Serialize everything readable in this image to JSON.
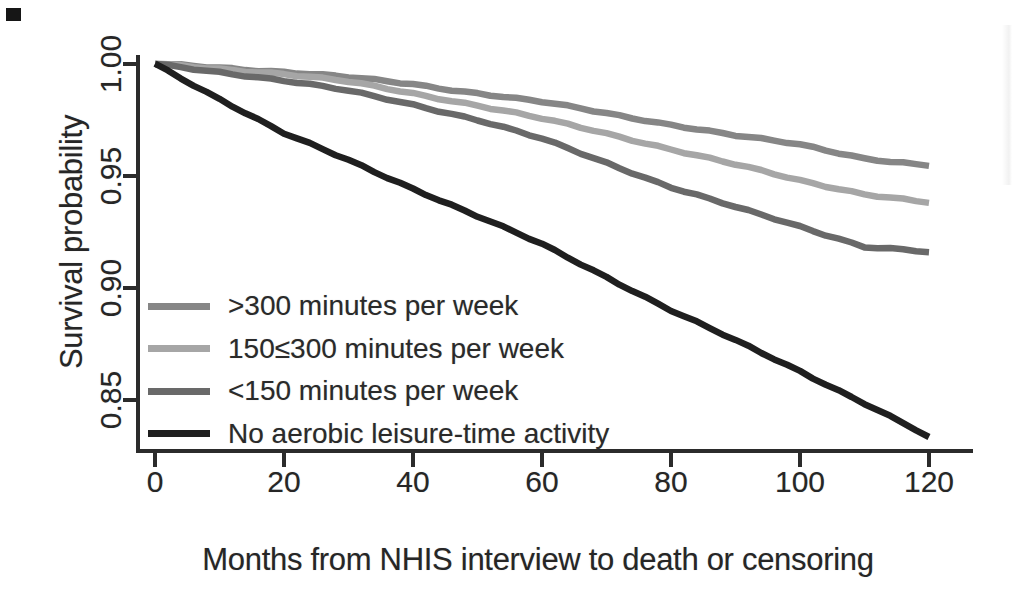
{
  "colors": {
    "background": "#ffffff",
    "axis": "#2b2b2b",
    "text": "#262626",
    "artifact_mark": "#161616"
  },
  "chart_data": {
    "type": "line",
    "title": "",
    "xlabel": "Months from NHIS interview to death or censoring",
    "ylabel": "Survival probability",
    "xlim": [
      0,
      120
    ],
    "ylim": [
      0.825,
      1.005
    ],
    "grid": false,
    "legend_position": "inside-middle-left",
    "x_ticks": [
      {
        "label": "0",
        "value": 0
      },
      {
        "label": "20",
        "value": 20
      },
      {
        "label": "40",
        "value": 40
      },
      {
        "label": "60",
        "value": 60
      },
      {
        "label": "80",
        "value": 80
      },
      {
        "label": "100",
        "value": 100
      },
      {
        "label": "120",
        "value": 120
      }
    ],
    "y_ticks": [
      {
        "label": "1.00",
        "value": 1.0
      },
      {
        "label": "0.95",
        "value": 0.95
      },
      {
        "label": "0.90",
        "value": 0.9
      },
      {
        "label": "0.85",
        "value": 0.85
      }
    ],
    "x": [
      0,
      10,
      20,
      30,
      40,
      50,
      60,
      70,
      80,
      90,
      100,
      110,
      120
    ],
    "series": [
      {
        "name": ">300 minutes per week",
        "color": "#868686",
        "values": [
          1.0,
          0.9985,
          0.9965,
          0.994,
          0.991,
          0.987,
          0.983,
          0.978,
          0.973,
          0.968,
          0.964,
          0.958,
          0.9545
        ]
      },
      {
        "name": "150≤300 minutes per week",
        "color": "#a6a6a6",
        "values": [
          1.0,
          0.998,
          0.9955,
          0.992,
          0.987,
          0.9815,
          0.9755,
          0.969,
          0.962,
          0.955,
          0.948,
          0.942,
          0.938
        ]
      },
      {
        "name": "<150 minutes per week",
        "color": "#696969",
        "values": [
          1.0,
          0.9965,
          0.9925,
          0.988,
          0.982,
          0.975,
          0.9665,
          0.956,
          0.945,
          0.936,
          0.9275,
          0.9185,
          0.916
        ]
      },
      {
        "name": "No aerobic leisure-time activity",
        "color": "#1f1f1f",
        "values": [
          1.0,
          0.9845,
          0.969,
          0.957,
          0.9445,
          0.932,
          0.9195,
          0.905,
          0.89,
          0.8765,
          0.863,
          0.8485,
          0.8335
        ]
      }
    ]
  }
}
